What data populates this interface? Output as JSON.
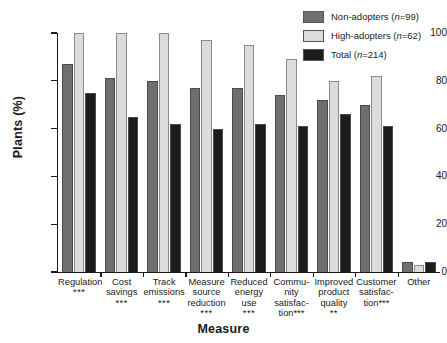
{
  "chart_data": {
    "type": "bar",
    "title": "",
    "xlabel": "Measure",
    "ylabel": "Plants (%)",
    "ylim": [
      0,
      100
    ],
    "yticks": [
      0,
      20,
      40,
      60,
      80,
      100
    ],
    "grid": false,
    "legend_position": "top-right",
    "categories": [
      "Regulation",
      "Cost savings",
      "Track emissions",
      "Measure source reduction",
      "Reduced energy use",
      "Community satisfaction",
      "Improved product quality",
      "Customer satisfaction",
      "Other"
    ],
    "category_significance": [
      "***",
      "***",
      "***",
      "***",
      "***",
      "***",
      "**",
      "***",
      ""
    ],
    "series": [
      {
        "name": "Non-adopters (n=99)",
        "color": "#6f6f6f",
        "values": [
          87,
          81,
          80,
          77,
          77,
          74,
          72,
          70,
          4
        ]
      },
      {
        "name": "High-adopters (n=62)",
        "color": "#dcdcdc",
        "values": [
          100,
          100,
          100,
          97,
          95,
          89,
          80,
          82,
          3
        ]
      },
      {
        "name": "Total (n=214)",
        "color": "#1c1c1c",
        "values": [
          75,
          65,
          62,
          60,
          62,
          61,
          66,
          61,
          4
        ]
      }
    ]
  },
  "legend": {
    "items": [
      {
        "label": "Non-adopters (",
        "n_italic": "n",
        "n_value": "=99)",
        "swatch": "#6f6f6f"
      },
      {
        "label": "High-adopters (",
        "n_italic": "n",
        "n_value": "=62)",
        "swatch": "#dcdcdc"
      },
      {
        "label": "Total (",
        "n_italic": "n",
        "n_value": "=214)",
        "swatch": "#1c1c1c"
      }
    ],
    "full_labels": [
      "Non-adopters (n=99)",
      "High-adopters (n=62)",
      "Total (n=214)"
    ]
  },
  "axes": {
    "y_title": "Plants (%)",
    "x_title": "Measure",
    "y_tick_labels": [
      "100",
      "80",
      "60",
      "40",
      "20",
      "0"
    ]
  },
  "category_labels": [
    {
      "lines": [
        "Regulation"
      ],
      "stars": "***"
    },
    {
      "lines": [
        "Cost",
        "savings"
      ],
      "stars": "***"
    },
    {
      "lines": [
        "Track",
        "emissions"
      ],
      "stars": "***"
    },
    {
      "lines": [
        "Measure",
        "source",
        "reduction"
      ],
      "stars": "***"
    },
    {
      "lines": [
        "Reduced",
        "energy",
        "use"
      ],
      "stars": "***"
    },
    {
      "lines": [
        "Commu-",
        "nity",
        "satisfac-",
        "tion***"
      ],
      "stars": ""
    },
    {
      "lines": [
        "Improved",
        "product",
        "quality"
      ],
      "stars": "**"
    },
    {
      "lines": [
        "Customer",
        "satisfac-",
        "tion***"
      ],
      "stars": ""
    },
    {
      "lines": [
        "Other"
      ],
      "stars": ""
    }
  ],
  "colors": {
    "non_adopters": "#6f6f6f",
    "high_adopters": "#dcdcdc",
    "total": "#1c1c1c",
    "axis": "#1a1a1a",
    "background": "#ffffff"
  }
}
